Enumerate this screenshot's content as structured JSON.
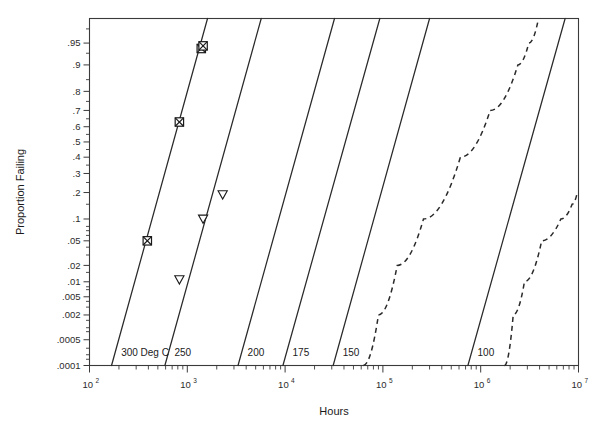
{
  "chart_data": {
    "type": "scatter",
    "title": "",
    "subtitle": "",
    "xlabel": "Hours",
    "ylabel": "Proportion Failing",
    "grid": false,
    "legend_position": "inline-line-labels",
    "x_scale": "log10",
    "y_scale": "normal-probability",
    "xlim": [
      100,
      10000000
    ],
    "ylim": [
      0.0001,
      0.98
    ],
    "x_tick_labels": [
      "10",
      "10",
      "10",
      "10",
      "10",
      "10"
    ],
    "x_tick_exponents": [
      "2",
      "3",
      "4",
      "5",
      "6",
      "7"
    ],
    "x_tick_values": [
      100,
      1000,
      10000,
      100000,
      1000000,
      10000000
    ],
    "y_tick_labels": [
      ".95",
      ".9",
      ".8",
      ".7",
      ".6",
      ".5",
      ".4",
      ".3",
      ".2",
      ".1",
      ".05",
      ".02",
      ".01",
      ".005",
      ".002",
      ".0005",
      ".0001"
    ],
    "y_tick_values": [
      0.95,
      0.9,
      0.8,
      0.7,
      0.6,
      0.5,
      0.4,
      0.3,
      0.2,
      0.1,
      0.05,
      0.02,
      0.01,
      0.005,
      0.002,
      0.0005,
      0.0001
    ],
    "series": [
      {
        "name": "300 Deg C",
        "label": "300 Deg C",
        "label_x": 180000000000,
        "style": "solid",
        "kind": "fit-line",
        "line_points": [
          [
            168,
            0.0001
          ],
          [
            1610,
            0.98
          ]
        ],
        "marker": "crossed-square",
        "points": [
          {
            "x": 390,
            "y": 0.05
          },
          {
            "x": 830,
            "y": 0.63
          },
          {
            "x": 1390,
            "y": 0.94
          },
          {
            "x": 1450,
            "y": 0.945
          }
        ]
      },
      {
        "name": "250",
        "label": "250",
        "style": "solid",
        "kind": "fit-line",
        "line_points": [
          [
            590,
            0.0001
          ],
          [
            5700,
            0.98
          ]
        ],
        "marker": "down-triangle",
        "points": [
          {
            "x": 830,
            "y": 0.011
          },
          {
            "x": 1450,
            "y": 0.1
          },
          {
            "x": 2300,
            "y": 0.19
          }
        ]
      },
      {
        "name": "200",
        "label": "200",
        "style": "solid",
        "kind": "fit-line",
        "line_points": [
          [
            3300,
            0.0001
          ],
          [
            32000,
            0.98
          ]
        ],
        "marker": "none",
        "points": []
      },
      {
        "name": "175",
        "label": "175",
        "style": "solid",
        "kind": "fit-line",
        "line_points": [
          [
            9500,
            0.0001
          ],
          [
            93000,
            0.98
          ]
        ],
        "marker": "none",
        "points": []
      },
      {
        "name": "150",
        "label": "150",
        "style": "solid",
        "kind": "fit-line",
        "line_points": [
          [
            31000,
            0.0001
          ],
          [
            300000,
            0.98
          ]
        ],
        "marker": "none",
        "points": []
      },
      {
        "name": "100",
        "label": "100",
        "style": "solid",
        "kind": "fit-line",
        "line_points": [
          [
            740000,
            0.0001
          ],
          [
            7300000,
            0.98
          ]
        ],
        "marker": "none",
        "points": []
      }
    ],
    "bounds": [
      {
        "name": "upper-confidence-bound",
        "style": "dashed",
        "points": [
          [
            63000,
            0.0001
          ],
          [
            90000,
            0.002
          ],
          [
            140000,
            0.02
          ],
          [
            260000,
            0.1
          ],
          [
            620000,
            0.4
          ],
          [
            1250000,
            0.7
          ],
          [
            2400000,
            0.9
          ],
          [
            3100000,
            0.95
          ],
          [
            3900000,
            0.98
          ]
        ]
      },
      {
        "name": "lower-confidence-bound",
        "style": "dashed",
        "points": [
          [
            1750000,
            0.0001
          ],
          [
            2150000,
            0.002
          ],
          [
            2800000,
            0.01
          ],
          [
            4200000,
            0.05
          ],
          [
            6600000,
            0.1
          ],
          [
            8600000,
            0.15
          ],
          [
            9600000,
            0.19
          ]
        ]
      }
    ],
    "annotations": []
  },
  "colors": {
    "line": "#2a2a2a",
    "axis": "#3a3a3a",
    "background": "#ffffff",
    "text": "#1a1a1a"
  }
}
